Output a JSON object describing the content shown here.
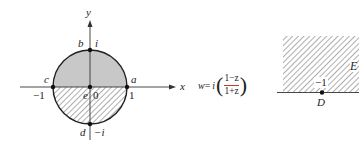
{
  "left_plane": {
    "axis_x_label": "x",
    "axis_y_label": "y",
    "points": {
      "a": {
        "label": "a",
        "value": "1"
      },
      "b": {
        "label": "b",
        "value": "i"
      },
      "c": {
        "label": "c",
        "value": "−1"
      },
      "d": {
        "label": "d",
        "value": "−i"
      },
      "e": {
        "label": "e",
        "value": "0"
      }
    },
    "upper_region": "shaded gray",
    "lower_region": "hatched"
  },
  "mapping": {
    "lhs": "w",
    "equals": "=",
    "factor": "i",
    "numerator": "1−z",
    "denominator": "1+z"
  },
  "right_plane": {
    "region_label": "E",
    "point_label": "D",
    "point_value": "−1",
    "region": "hatched upper half-plane"
  },
  "colors": {
    "ink": "#222222",
    "fill": "#c8c8c8",
    "fraction_bar": "#c0392b"
  }
}
